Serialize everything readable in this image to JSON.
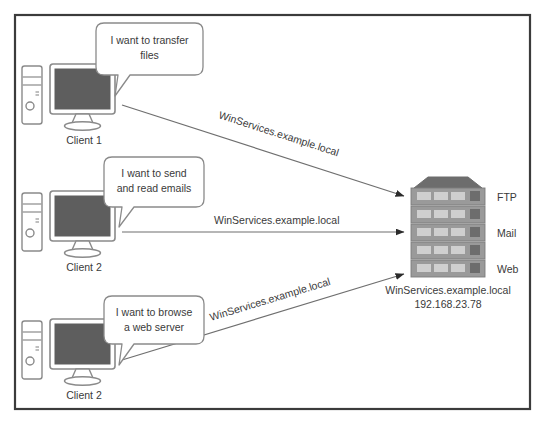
{
  "figure": {
    "border_color": "#3b3b3b",
    "background": "#ffffff"
  },
  "palette": {
    "line": "#6f6f6f",
    "arrow": "#2b2b2b",
    "screen": "#5e5e5e",
    "device_outline": "#8a8a8a",
    "server_body": "#9a9a9a",
    "server_top": "#6d6d6d",
    "server_slot": "#cfcfcf",
    "text": "#3a3a3a",
    "bubble_outline": "#8a8a8a"
  },
  "clients": [
    {
      "id": "client-1",
      "label": "Client 1",
      "bubble": {
        "lines": [
          "I want to transfer",
          "files"
        ],
        "align": "center"
      }
    },
    {
      "id": "client-2-mail",
      "label": "Client 2",
      "bubble": {
        "lines": [
          "I want to send",
          "and read emails"
        ],
        "align": "center"
      }
    },
    {
      "id": "client-2-web",
      "label": "Client 2",
      "bubble": {
        "lines": [
          "I want to browse",
          "a web server"
        ],
        "align": "center"
      }
    }
  ],
  "connections": [
    {
      "id": "connection-ftp",
      "label": "WinServices.example.local",
      "orientation": "diagonal-down",
      "from": "client-1",
      "to": "server"
    },
    {
      "id": "connection-mail",
      "label": "WinServices.example.local",
      "orientation": "horizontal",
      "from": "client-2-mail",
      "to": "server"
    },
    {
      "id": "connection-web",
      "label": "WinServices.example.local",
      "orientation": "diagonal-up",
      "from": "client-2-web",
      "to": "server"
    }
  ],
  "server": {
    "id": "server-rack",
    "unit_count": 5,
    "service_labels": [
      "FTP",
      "Mail",
      "Web"
    ],
    "hostname": "WinServices.example.local",
    "ip_address": "192.168.23.78"
  }
}
